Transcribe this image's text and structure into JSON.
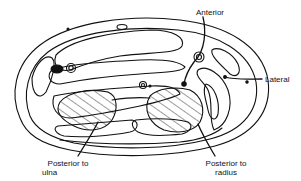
{
  "diagram": {
    "colors": {
      "stroke": "#111111",
      "background": "#ffffff",
      "hatch": "#222222"
    },
    "labels": {
      "anterior": "Anterior",
      "lateral": "Lateral",
      "posterior_ulna_line1": "Posterior to",
      "posterior_ulna_line2": "ulna",
      "posterior_radius_line1": "Posterior to",
      "posterior_radius_line2": "radius"
    }
  }
}
